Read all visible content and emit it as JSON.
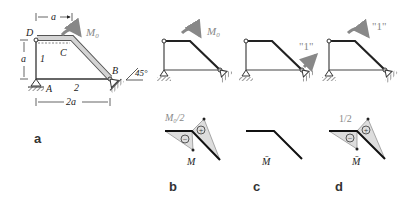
{
  "figure": {
    "panel_a": {
      "label": "a",
      "nodes": {
        "D": "D",
        "C": "C",
        "A": "A",
        "B": "B"
      },
      "members": {
        "m1": "1",
        "m2": "2"
      },
      "dims": {
        "top": "a",
        "left": "a",
        "bottom": "2a"
      },
      "moment": "M",
      "moment_sub": "0",
      "angle": "45°"
    },
    "panel_b": {
      "label": "b",
      "moment": "M",
      "moment_sub": "0",
      "diagram_value": "M₀/2",
      "diagram_name": "M",
      "signs": {
        "neg": "−",
        "pos": "+"
      }
    },
    "panel_c": {
      "label": "c",
      "unit_load": "\"1\"",
      "diagram_name": "M̄"
    },
    "panel_d": {
      "label": "d",
      "unit_moment": "\"1\"",
      "diagram_value": "1/2",
      "diagram_name": "M̄",
      "signs": {
        "neg": "−",
        "pos": "+"
      }
    }
  }
}
